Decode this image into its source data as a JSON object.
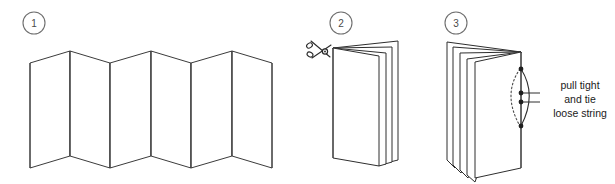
{
  "diagram": {
    "background_color": "#ffffff",
    "line_color": "#3b3b3b",
    "text_color": "#1a1a1a",
    "width": 615,
    "height": 184
  },
  "steps": [
    {
      "number": "1",
      "name": "accordion-fold-strip",
      "description": "Paper strip folded accordion style",
      "panel_count": 8,
      "peak_count": 3,
      "valley_count": 3
    },
    {
      "number": "2",
      "name": "folded-booklet-with-scissors",
      "description": "Folded booklet with scissors cutting at the spine corner",
      "leaf_count": 3,
      "tool": "scissors-icon"
    },
    {
      "number": "3",
      "name": "bound-booklet-with-string",
      "description": "Booklet with string threaded through spine holes",
      "leaf_count": 4,
      "hole_count": 4,
      "annotation_lines": [
        "pull tight",
        "and tie",
        "loose string"
      ]
    }
  ],
  "annotation": {
    "line1": "pull tight",
    "line2": "and tie",
    "line3": "loose string"
  }
}
